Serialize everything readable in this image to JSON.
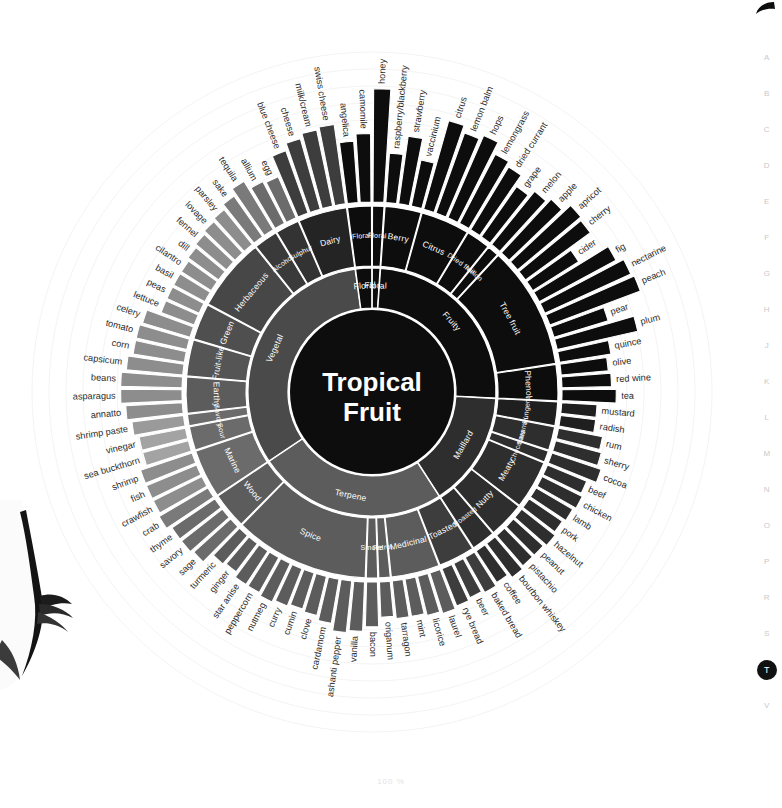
{
  "page": {
    "axis_label": "100 %",
    "center_line1": "Tropical",
    "center_line2": "Fruit"
  },
  "index_rail": {
    "letters": [
      "A",
      "B",
      "C",
      "D",
      "E",
      "F",
      "G",
      "H",
      "J",
      "K",
      "L",
      "M",
      "N",
      "O",
      "P",
      "R",
      "S",
      "T",
      "V"
    ],
    "active": "T"
  },
  "colors": {
    "black": "#0d0d0d",
    "dark": "#1f1f1f",
    "dark2": "#2e2e2e",
    "mid": "#4a4a4a",
    "mid2": "#5c5c5c",
    "grey": "#7a7a7a",
    "grey2": "#8d8d8d",
    "light": "#a3a3a3",
    "lighter": "#b5b5b5",
    "separator": "#ffffff",
    "leaf_text": "#2b2b2b",
    "ring_text": "#ffffff",
    "guide": "#f2f2f2"
  },
  "chart_data": {
    "type": "sunburst",
    "center": "Tropical Fruit",
    "units": "100 %",
    "rings": [
      "inner_category",
      "mid_group",
      "outer_leaf"
    ],
    "start_angle_deg": -90,
    "inner_categories": [
      {
        "name": "Floral",
        "span": 22,
        "color": "#0d0d0d"
      },
      {
        "name": "Fruity",
        "span": 88,
        "color": "#0d0d0d"
      },
      {
        "name": "Maillard",
        "span": 74,
        "color": "#2e2e2e"
      },
      {
        "name": "Terpene",
        "span": 84,
        "color": "#5c5c5c"
      },
      {
        "name": "Vegetal",
        "span": 92,
        "color": "#4a4a4a"
      }
    ],
    "mid_groups": [
      {
        "name": "Floral",
        "parent": "Floral",
        "color": "#0d0d0d"
      },
      {
        "name": "Berry",
        "parent": "Fruity",
        "color": "#0d0d0d"
      },
      {
        "name": "Citrus",
        "parent": "Fruity",
        "color": "#0d0d0d"
      },
      {
        "name": "Dried fruit",
        "parent": "Fruity",
        "color": "#0d0d0d"
      },
      {
        "name": "Melon",
        "parent": "Fruity",
        "color": "#0d0d0d"
      },
      {
        "name": "Tree fruit",
        "parent": "Fruity",
        "color": "#0d0d0d"
      },
      {
        "name": "Phenol",
        "parent": "Fruity",
        "color": "#0d0d0d"
      },
      {
        "name": "Pungent",
        "parent": "Maillard",
        "color": "#1f1f1f"
      },
      {
        "name": "Caramel",
        "parent": "Maillard",
        "color": "#2e2e2e"
      },
      {
        "name": "Chocolate",
        "parent": "Maillard",
        "color": "#2e2e2e"
      },
      {
        "name": "Meaty",
        "parent": "Maillard",
        "color": "#2e2e2e"
      },
      {
        "name": "Nutty",
        "parent": "Maillard",
        "color": "#2e2e2e"
      },
      {
        "name": "Roasted",
        "parent": "Maillard",
        "color": "#2e2e2e"
      },
      {
        "name": "Toasted",
        "parent": "Terpene",
        "color": "#3d3d3d"
      },
      {
        "name": "Medicinal",
        "parent": "Terpene",
        "color": "#5c5c5c"
      },
      {
        "name": "Petrol",
        "parent": "Terpene",
        "color": "#5c5c5c"
      },
      {
        "name": "Smoke",
        "parent": "Terpene",
        "color": "#5c5c5c"
      },
      {
        "name": "Spice",
        "parent": "Terpene",
        "color": "#5c5c5c"
      },
      {
        "name": "Wood",
        "parent": "Terpene",
        "color": "#5c5c5c"
      },
      {
        "name": "Marine",
        "parent": "Vegetal",
        "color": "#6b6b6b"
      },
      {
        "name": "Sour",
        "parent": "Vegetal",
        "color": "#6b6b6b"
      },
      {
        "name": "Savory",
        "parent": "Vegetal",
        "color": "#6b6b6b"
      },
      {
        "name": "Earthy",
        "parent": "Vegetal",
        "color": "#5c5c5c"
      },
      {
        "name": "Fruit-like",
        "parent": "Vegetal",
        "color": "#555555"
      },
      {
        "name": "Green",
        "parent": "Vegetal",
        "color": "#4f4f4f"
      },
      {
        "name": "Herbaceous",
        "parent": "Vegetal",
        "color": "#474747"
      },
      {
        "name": "Alcohol",
        "parent": "Vegetal",
        "color": "#3a3a3a"
      },
      {
        "name": "Sulphur",
        "parent": "Vegetal",
        "color": "#333333"
      },
      {
        "name": "Dairy",
        "parent": "Vegetal",
        "color": "#242424"
      }
    ],
    "outer_leaves": [
      {
        "label": "honey",
        "group": "Floral",
        "value": 96,
        "color": "#0d0d0d"
      },
      {
        "label": "raspberry/blackberry",
        "group": "Berry",
        "value": 42,
        "color": "#0d0d0d"
      },
      {
        "label": "strawberry",
        "group": "Berry",
        "value": 58,
        "color": "#0d0d0d"
      },
      {
        "label": "vaccinium",
        "group": "Berry",
        "value": 40,
        "color": "#0d0d0d"
      },
      {
        "label": "citrus",
        "group": "Citrus",
        "value": 78,
        "color": "#0d0d0d"
      },
      {
        "label": "lemon balm",
        "group": "Citrus",
        "value": 72,
        "color": "#0d0d0d"
      },
      {
        "label": "hops",
        "group": "Citrus",
        "value": 76,
        "color": "#0d0d0d"
      },
      {
        "label": "lemongrass",
        "group": "Citrus",
        "value": 66,
        "color": "#0d0d0d"
      },
      {
        "label": "dried currant",
        "group": "Dried fruit",
        "value": 62,
        "color": "#0d0d0d"
      },
      {
        "label": "grape",
        "group": "Dried fruit",
        "value": 52,
        "color": "#0d0d0d"
      },
      {
        "label": "melon",
        "group": "Melon",
        "value": 58,
        "color": "#0d0d0d"
      },
      {
        "label": "apple",
        "group": "Tree fruit",
        "value": 62,
        "color": "#0d0d0d"
      },
      {
        "label": "apricot",
        "group": "Tree fruit",
        "value": 70,
        "color": "#0d0d0d"
      },
      {
        "label": "cherry",
        "group": "Tree fruit",
        "value": 68,
        "color": "#0d0d0d"
      },
      {
        "label": "cider",
        "group": "Tree fruit",
        "value": 46,
        "color": "#0d0d0d"
      },
      {
        "label": "fig",
        "group": "Tree fruit",
        "value": 74,
        "color": "#0d0d0d"
      },
      {
        "label": "nectarine",
        "group": "Tree fruit",
        "value": 80,
        "color": "#0d0d0d"
      },
      {
        "label": "peach",
        "group": "Tree fruit",
        "value": 82,
        "color": "#0d0d0d"
      },
      {
        "label": "pear",
        "group": "Tree fruit",
        "value": 48,
        "color": "#0d0d0d"
      },
      {
        "label": "plum",
        "group": "Tree fruit",
        "value": 70,
        "color": "#0d0d0d"
      },
      {
        "label": "quince",
        "group": "Tree fruit",
        "value": 44,
        "color": "#0d0d0d"
      },
      {
        "label": "olive",
        "group": "Phenol",
        "value": 40,
        "color": "#0d0d0d"
      },
      {
        "label": "red wine",
        "group": "Phenol",
        "value": 42,
        "color": "#0d0d0d"
      },
      {
        "label": "tea",
        "group": "Phenol",
        "value": 46,
        "color": "#0d0d0d"
      },
      {
        "label": "mustard",
        "group": "Pungent",
        "value": 30,
        "color": "#1f1f1f"
      },
      {
        "label": "radish",
        "group": "Pungent",
        "value": 30,
        "color": "#1f1f1f"
      },
      {
        "label": "rum",
        "group": "Caramel",
        "value": 38,
        "color": "#2e2e2e"
      },
      {
        "label": "sherry",
        "group": "Caramel",
        "value": 40,
        "color": "#2e2e2e"
      },
      {
        "label": "cocoa",
        "group": "Chocolate",
        "value": 44,
        "color": "#2e2e2e"
      },
      {
        "label": "beef",
        "group": "Meaty",
        "value": 36,
        "color": "#2e2e2e"
      },
      {
        "label": "chicken",
        "group": "Meaty",
        "value": 38,
        "color": "#2e2e2e"
      },
      {
        "label": "lamb",
        "group": "Meaty",
        "value": 36,
        "color": "#2e2e2e"
      },
      {
        "label": "pork",
        "group": "Meaty",
        "value": 34,
        "color": "#2e2e2e"
      },
      {
        "label": "hazelnut",
        "group": "Nutty",
        "value": 36,
        "color": "#2e2e2e"
      },
      {
        "label": "peanut",
        "group": "Nutty",
        "value": 34,
        "color": "#2e2e2e"
      },
      {
        "label": "pistachio",
        "group": "Nutty",
        "value": 34,
        "color": "#2e2e2e"
      },
      {
        "label": "bourbon whiskey",
        "group": "Roasted",
        "value": 36,
        "color": "#2e2e2e"
      },
      {
        "label": "coffee",
        "group": "Roasted",
        "value": 32,
        "color": "#2e2e2e"
      },
      {
        "label": "baked bread",
        "group": "Toasted",
        "value": 34,
        "color": "#3d3d3d"
      },
      {
        "label": "beer",
        "group": "Toasted",
        "value": 32,
        "color": "#3d3d3d"
      },
      {
        "label": "rye bread",
        "group": "Toasted",
        "value": 34,
        "color": "#3d3d3d"
      },
      {
        "label": "laurel",
        "group": "Medicinal",
        "value": 36,
        "color": "#5c5c5c"
      },
      {
        "label": "licorice",
        "group": "Medicinal",
        "value": 34,
        "color": "#5c5c5c"
      },
      {
        "label": "mint",
        "group": "Medicinal",
        "value": 32,
        "color": "#5c5c5c"
      },
      {
        "label": "tarragon",
        "group": "Medicinal",
        "value": 32,
        "color": "#5c5c5c"
      },
      {
        "label": "origanum",
        "group": "Petrol",
        "value": 30,
        "color": "#5c5c5c"
      },
      {
        "label": "bacon",
        "group": "Smoke",
        "value": 38,
        "color": "#5c5c5c"
      },
      {
        "label": "vanilla",
        "group": "Spice",
        "value": 42,
        "color": "#5c5c5c"
      },
      {
        "label": "ashanti pepper",
        "group": "Spice",
        "value": 44,
        "color": "#5c5c5c"
      },
      {
        "label": "cardamom",
        "group": "Spice",
        "value": 38,
        "color": "#5c5c5c"
      },
      {
        "label": "clove",
        "group": "Spice",
        "value": 34,
        "color": "#5c5c5c"
      },
      {
        "label": "cumin",
        "group": "Spice",
        "value": 32,
        "color": "#5c5c5c"
      },
      {
        "label": "curry",
        "group": "Spice",
        "value": 34,
        "color": "#5c5c5c"
      },
      {
        "label": "nutmeg",
        "group": "Spice",
        "value": 36,
        "color": "#5c5c5c"
      },
      {
        "label": "peppercorn",
        "group": "Spice",
        "value": 34,
        "color": "#5c5c5c"
      },
      {
        "label": "star anise",
        "group": "Spice",
        "value": 34,
        "color": "#5c5c5c"
      },
      {
        "label": "ginger",
        "group": "Spice",
        "value": 30,
        "color": "#5c5c5c"
      },
      {
        "label": "turmeric",
        "group": "Spice",
        "value": 32,
        "color": "#5c5c5c"
      },
      {
        "label": "sage",
        "group": "Wood",
        "value": 42,
        "color": "#6b6b6b"
      },
      {
        "label": "savory",
        "group": "Wood",
        "value": 44,
        "color": "#6b6b6b"
      },
      {
        "label": "thyme",
        "group": "Wood",
        "value": 44,
        "color": "#6b6b6b"
      },
      {
        "label": "crab",
        "group": "Marine",
        "value": 48,
        "color": "#7a7a7a"
      },
      {
        "label": "crawfish",
        "group": "Marine",
        "value": 46,
        "color": "#8d8d8d"
      },
      {
        "label": "fish",
        "group": "Marine",
        "value": 46,
        "color": "#8d8d8d"
      },
      {
        "label": "shrimp",
        "group": "Marine",
        "value": 46,
        "color": "#8d8d8d"
      },
      {
        "label": "sea buckthorn",
        "group": "Sour",
        "value": 40,
        "color": "#a3a3a3"
      },
      {
        "label": "vinegar",
        "group": "Sour",
        "value": 40,
        "color": "#a3a3a3"
      },
      {
        "label": "shrimp paste",
        "group": "Savory",
        "value": 44,
        "color": "#9a9a9a"
      },
      {
        "label": "annatto",
        "group": "Earthy",
        "value": 48,
        "color": "#8d8d8d"
      },
      {
        "label": "asparagus",
        "group": "Earthy",
        "value": 52,
        "color": "#8d8d8d"
      },
      {
        "label": "beans",
        "group": "Earthy",
        "value": 52,
        "color": "#8d8d8d"
      },
      {
        "label": "capsicum",
        "group": "Fruit-like",
        "value": 48,
        "color": "#8d8d8d"
      },
      {
        "label": "corn",
        "group": "Fruit-like",
        "value": 44,
        "color": "#8d8d8d"
      },
      {
        "label": "tomato",
        "group": "Fruit-like",
        "value": 44,
        "color": "#8d8d8d"
      },
      {
        "label": "celery",
        "group": "Green",
        "value": 42,
        "color": "#8d8d8d"
      },
      {
        "label": "lettuce",
        "group": "Green",
        "value": 30,
        "color": "#8d8d8d"
      },
      {
        "label": "peas",
        "group": "Green",
        "value": 30,
        "color": "#8d8d8d"
      },
      {
        "label": "basil",
        "group": "Herbaceous",
        "value": 30,
        "color": "#8d8d8d"
      },
      {
        "label": "cilantro",
        "group": "Herbaceous",
        "value": 30,
        "color": "#8d8d8d"
      },
      {
        "label": "dill",
        "group": "Herbaceous",
        "value": 32,
        "color": "#8d8d8d"
      },
      {
        "label": "fennel",
        "group": "Herbaceous",
        "value": 34,
        "color": "#8d8d8d"
      },
      {
        "label": "lovage",
        "group": "Herbaceous",
        "value": 36,
        "color": "#8d8d8d"
      },
      {
        "label": "parsley",
        "group": "Herbaceous",
        "value": 38,
        "color": "#8d8d8d"
      },
      {
        "label": "sake",
        "group": "Alcohol",
        "value": 42,
        "color": "#7a7a7a"
      },
      {
        "label": "tequila",
        "group": "Alcohol",
        "value": 48,
        "color": "#7a7a7a"
      },
      {
        "label": "allium",
        "group": "Sulphur",
        "value": 40,
        "color": "#6b6b6b"
      },
      {
        "label": "egg",
        "group": "Sulphur",
        "value": 38,
        "color": "#6b6b6b"
      },
      {
        "label": "blue cheese",
        "group": "Dairy",
        "value": 56,
        "color": "#3d3d3d"
      },
      {
        "label": "cheese",
        "group": "Dairy",
        "value": 62,
        "color": "#3d3d3d"
      },
      {
        "label": "milk/cream",
        "group": "Dairy",
        "value": 66,
        "color": "#3d3d3d"
      },
      {
        "label": "swiss cheese",
        "group": "Dairy",
        "value": 68,
        "color": "#3d3d3d"
      },
      {
        "label": "angelica",
        "group": "Floral",
        "value": 52,
        "color": "#0d0d0d"
      },
      {
        "label": "camomile",
        "group": "Floral",
        "value": 58,
        "color": "#0d0d0d"
      }
    ]
  }
}
